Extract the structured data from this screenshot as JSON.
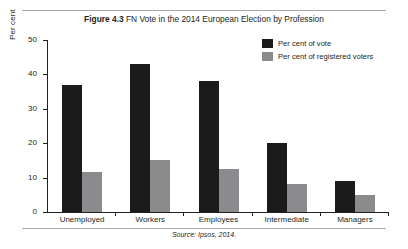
{
  "figure": {
    "number_label": "Figure 4.3",
    "title": "FN Vote in the 2014 European Election by Profession",
    "source": "Source: Ipsos, 2014."
  },
  "legend": {
    "position": "top-right",
    "items": [
      {
        "label": "Per cent of vote",
        "color": "#1b1b1b"
      },
      {
        "label": "Per cent of registered voters",
        "color": "#8b8b8d"
      }
    ]
  },
  "axes": {
    "ylabel": "Per cent",
    "yticks": [
      "0",
      "10",
      "20",
      "30",
      "40",
      "50"
    ]
  },
  "chart_data": {
    "type": "bar",
    "title": "FN Vote in the 2014 European Election by Profession",
    "xlabel": "",
    "ylabel": "Per cent",
    "ylim": [
      0,
      50
    ],
    "yticks": [
      0,
      10,
      20,
      30,
      40,
      50
    ],
    "grid": false,
    "legend_position": "top-right",
    "categories": [
      "Unemployed",
      "Workers",
      "Employees",
      "Intermediate",
      "Managers"
    ],
    "series": [
      {
        "name": "Per cent of vote",
        "color": "#1b1b1b",
        "values": [
          37,
          43,
          38,
          20,
          9
        ]
      },
      {
        "name": "Per cent of registered voters",
        "color": "#8b8b8d",
        "values": [
          11.5,
          15,
          12.5,
          8,
          5
        ]
      }
    ],
    "source": "Source: Ipsos, 2014."
  }
}
